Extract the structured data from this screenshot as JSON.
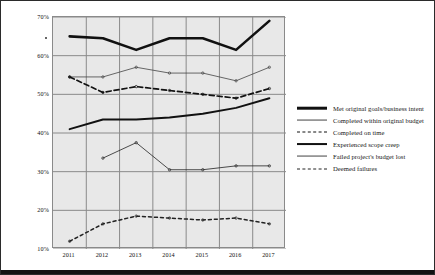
{
  "chart_data": {
    "type": "line",
    "title": "",
    "xlabel": "",
    "ylabel": "",
    "categories": [
      "2011",
      "2012",
      "2013",
      "2014",
      "2015",
      "2016",
      "2017"
    ],
    "x": [
      2011,
      2012,
      2013,
      2014,
      2015,
      2016,
      2017
    ],
    "ylim": [
      10,
      70
    ],
    "ytick_labels": [
      "70%",
      "60%",
      "50%",
      "40%",
      "30%",
      "20%",
      "10%"
    ],
    "ytick_values": [
      70,
      60,
      50,
      40,
      30,
      20,
      10
    ],
    "grid": true,
    "legend_position": "right",
    "series": [
      {
        "name": "Met original goals/business intent",
        "style": "solid-thick",
        "color": "#111111",
        "values": [
          65.0,
          64.5,
          61.5,
          64.5,
          64.5,
          61.5,
          69.0
        ]
      },
      {
        "name": "Completed within original budget",
        "style": "solid-thin",
        "color": "#444444",
        "values": [
          54.5,
          54.5,
          57.0,
          55.5,
          55.5,
          53.5,
          57.0
        ]
      },
      {
        "name": "Completed on time",
        "style": "dashed",
        "color": "#111111",
        "values": [
          54.5,
          50.5,
          52.0,
          51.0,
          50.0,
          49.0,
          51.5
        ]
      },
      {
        "name": "Experienced scope creep",
        "style": "solid-medium",
        "color": "#111111",
        "values": [
          41.0,
          43.5,
          43.5,
          44.0,
          45.0,
          46.5,
          49.0
        ]
      },
      {
        "name": "Failed project's budget lost",
        "style": "solid-thin",
        "color": "#222222",
        "values": [
          null,
          33.5,
          37.5,
          30.5,
          30.5,
          31.5,
          31.5
        ]
      },
      {
        "name": "Deemed failures",
        "style": "dotted",
        "color": "#222222",
        "values": [
          12.0,
          16.5,
          18.5,
          18.0,
          17.5,
          18.0,
          16.5
        ]
      }
    ]
  },
  "legend": {
    "items": [
      {
        "label": "Met original goals/business intent",
        "key": "solid-thick"
      },
      {
        "label": "Completed within original budget",
        "key": "solid-thin"
      },
      {
        "label": "Completed on time",
        "key": "dashed"
      },
      {
        "label": "Experienced scope creep",
        "key": "solid-medium"
      },
      {
        "label": "Failed project's budget lost",
        "key": "solid-thin"
      },
      {
        "label": "Deemed failures",
        "key": "dotted"
      }
    ]
  },
  "axes": {
    "y_ticks": [
      "70%",
      "60%",
      "50%",
      "40%",
      "30%",
      "20%",
      "10%"
    ],
    "x_ticks": [
      "2011",
      "2012",
      "2013",
      "2014",
      "2015",
      "2016",
      "2017"
    ]
  },
  "colors": {
    "plot_background": "#e8e8e8",
    "gridline": "#8a8a8a",
    "ink": "#111111",
    "page_background": "#ffffff"
  }
}
